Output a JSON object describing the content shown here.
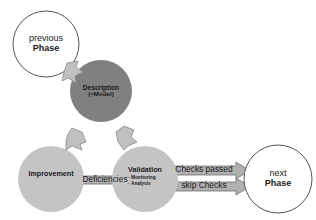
{
  "diagram": {
    "colors": {
      "background": "#ffffff",
      "outline_circle_fill": "#ffffff",
      "outline_circle_stroke": "#555555",
      "description_fill": "#808080",
      "process_fill": "#c4c4c4",
      "arrow_fill": "#b0b0b0",
      "arrow_stroke": "#6e6e6e",
      "chevron_fill": "#c0c0c0",
      "chevron_stroke": "#8a8a8a",
      "text": "#1a1a1a"
    },
    "nodes": [
      {
        "id": "previous-phase",
        "shape": "circle-outline",
        "line1": "previous",
        "line2": "Phase"
      },
      {
        "id": "description",
        "shape": "circle-filled-dark",
        "line1": "Description",
        "line2": "(=Model)"
      },
      {
        "id": "improvement",
        "shape": "circle-filled-light",
        "line1": "Improvement"
      },
      {
        "id": "validation",
        "shape": "circle-filled-light",
        "line1": "Validation",
        "bullets": [
          "Monitoring",
          "Analysis"
        ]
      },
      {
        "id": "next-phase",
        "shape": "circle-outline",
        "line1": "next",
        "line2": "Phase"
      }
    ],
    "arrows": [
      {
        "id": "deficiencies",
        "label": "Deficiencies",
        "from": "validation",
        "to": "improvement",
        "direction": "left"
      },
      {
        "id": "checks-passed",
        "label": "Checks passed",
        "from": "validation",
        "to": "next-phase",
        "direction": "right"
      },
      {
        "id": "skip-checks",
        "label": "skip Checks",
        "from": "validation",
        "to": "next-phase",
        "direction": "right"
      },
      {
        "id": "previous-to-description",
        "label": "",
        "from": "previous-phase",
        "to": "description",
        "direction": "down-right"
      },
      {
        "id": "description-to-improvement",
        "label": "",
        "from": "description",
        "to": "improvement",
        "direction": "down-left"
      },
      {
        "id": "description-to-validation",
        "label": "",
        "from": "description",
        "to": "validation",
        "direction": "down-right"
      }
    ]
  }
}
